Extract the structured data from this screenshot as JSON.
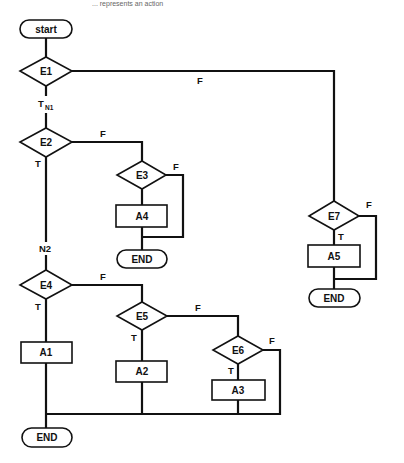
{
  "caption": "... represents an action",
  "colors": {
    "stroke": "#111111",
    "background": "#ffffff"
  },
  "nodes": {
    "start": {
      "type": "terminal",
      "label": "start"
    },
    "E1": {
      "type": "decision",
      "label": "E1"
    },
    "E2": {
      "type": "decision",
      "label": "E2"
    },
    "E3": {
      "type": "decision",
      "label": "E3"
    },
    "E4": {
      "type": "decision",
      "label": "E4"
    },
    "E5": {
      "type": "decision",
      "label": "E5"
    },
    "E6": {
      "type": "decision",
      "label": "E6"
    },
    "E7": {
      "type": "decision",
      "label": "E7"
    },
    "A1": {
      "type": "action",
      "label": "A1"
    },
    "A2": {
      "type": "action",
      "label": "A2"
    },
    "A3": {
      "type": "action",
      "label": "A3"
    },
    "A4": {
      "type": "action",
      "label": "A4"
    },
    "A5": {
      "type": "action",
      "label": "A5"
    },
    "end1": {
      "type": "terminal",
      "label": "END"
    },
    "end2": {
      "type": "terminal",
      "label": "END"
    },
    "end3": {
      "type": "terminal",
      "label": "END"
    }
  },
  "edge_labels": {
    "e1_true": "T",
    "e1_true_sub": "N1",
    "e1_false": "F",
    "e2_true": "T",
    "e2_false": "F",
    "e3_false": "F",
    "e4_true": "T",
    "e4_false": "F",
    "e5_true": "T",
    "e5_false": "F",
    "e6_true": "T",
    "e6_false": "F",
    "e7_true": "T",
    "e7_false": "F",
    "n2": "N2"
  },
  "edges": [
    {
      "from": "start",
      "to": "E1"
    },
    {
      "from": "E1",
      "to": "E2",
      "label": "T",
      "node": "N1"
    },
    {
      "from": "E1",
      "to": "E7",
      "label": "F"
    },
    {
      "from": "E2",
      "to": "E4",
      "label": "T",
      "node": "N2"
    },
    {
      "from": "E2",
      "to": "E3",
      "label": "F"
    },
    {
      "from": "E3",
      "to": "A4",
      "label": "T"
    },
    {
      "from": "E3",
      "to": "end1",
      "label": "F"
    },
    {
      "from": "A4",
      "to": "end1"
    },
    {
      "from": "E7",
      "to": "A5",
      "label": "T"
    },
    {
      "from": "E7",
      "to": "end2",
      "label": "F"
    },
    {
      "from": "A5",
      "to": "end2"
    },
    {
      "from": "E4",
      "to": "A1",
      "label": "T"
    },
    {
      "from": "E4",
      "to": "E5",
      "label": "F"
    },
    {
      "from": "E5",
      "to": "A2",
      "label": "T"
    },
    {
      "from": "E5",
      "to": "E6",
      "label": "F"
    },
    {
      "from": "E6",
      "to": "A3",
      "label": "T"
    },
    {
      "from": "E6",
      "to": "end3",
      "label": "F"
    },
    {
      "from": "A1",
      "to": "end3"
    },
    {
      "from": "A2",
      "to": "end3"
    },
    {
      "from": "A3",
      "to": "end3"
    }
  ]
}
